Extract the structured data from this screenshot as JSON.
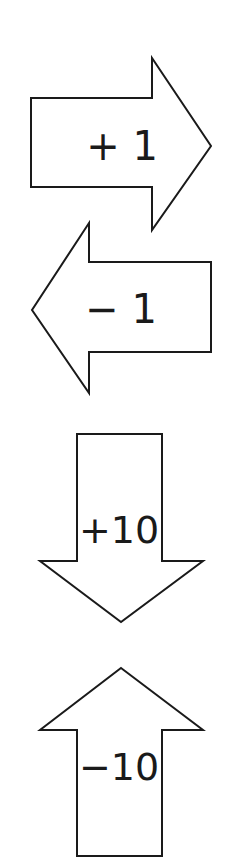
{
  "arrows": [
    {
      "id": "right",
      "direction": "right",
      "label": "+ 1",
      "increment": 1
    },
    {
      "id": "left",
      "direction": "left",
      "label": "− 1",
      "increment": -1
    },
    {
      "id": "down",
      "direction": "down",
      "label": "+10",
      "increment": 10
    },
    {
      "id": "up",
      "direction": "up",
      "label": "−10",
      "increment": -10
    }
  ],
  "colors": {
    "stroke": "#1a1a1a",
    "fill": "#ffffff",
    "background": "#ffffff"
  }
}
